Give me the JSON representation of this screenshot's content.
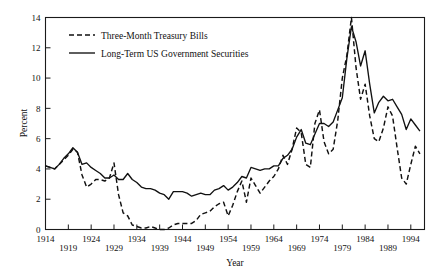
{
  "chart_data": {
    "type": "line",
    "title": "",
    "xlabel": "Year",
    "ylabel": "Percent",
    "xlim": [
      1914,
      1997
    ],
    "ylim": [
      0,
      14
    ],
    "grid": false,
    "legend_position": "top-left",
    "xticks": [
      1914,
      1919,
      1924,
      1929,
      1934,
      1939,
      1944,
      1949,
      1954,
      1959,
      1964,
      1969,
      1974,
      1979,
      1984,
      1989,
      1994
    ],
    "xtick_labels": [
      "1914",
      "1919",
      "1924",
      "1929",
      "1934",
      "1939",
      "1944",
      "1949",
      "1954",
      "1959",
      "1964",
      "1969",
      "1974",
      "1979",
      "1984",
      "1989",
      "1994"
    ],
    "xtick_stagger": "alternating-two-rows",
    "yticks": [
      0,
      2,
      4,
      6,
      8,
      10,
      12,
      14
    ],
    "ytick_labels": [
      "0",
      "2",
      "4",
      "6",
      "8",
      "10",
      "12",
      "14"
    ],
    "x": [
      1914,
      1915,
      1916,
      1917,
      1918,
      1919,
      1920,
      1921,
      1922,
      1923,
      1924,
      1925,
      1926,
      1927,
      1928,
      1929,
      1930,
      1931,
      1932,
      1933,
      1934,
      1935,
      1936,
      1937,
      1938,
      1939,
      1940,
      1941,
      1942,
      1943,
      1944,
      1945,
      1946,
      1947,
      1948,
      1949,
      1950,
      1951,
      1952,
      1953,
      1954,
      1955,
      1956,
      1957,
      1958,
      1959,
      1960,
      1961,
      1962,
      1963,
      1964,
      1965,
      1966,
      1967,
      1968,
      1969,
      1970,
      1971,
      1972,
      1973,
      1974,
      1975,
      1976,
      1977,
      1978,
      1979,
      1980,
      1981,
      1982,
      1983,
      1984,
      1985,
      1986,
      1987,
      1988,
      1989,
      1990,
      1991,
      1992,
      1993,
      1994,
      1995,
      1996
    ],
    "series": [
      {
        "name": "Three-Month Treasury Bills",
        "style": "dashed",
        "color": "#111111",
        "values": [
          4.2,
          4.1,
          4.0,
          4.3,
          4.6,
          4.9,
          5.3,
          5.1,
          3.6,
          2.8,
          3.0,
          3.3,
          3.3,
          3.2,
          3.4,
          4.4,
          2.3,
          1.1,
          0.9,
          0.3,
          0.2,
          0.1,
          0.1,
          0.2,
          0.1,
          0.0,
          0.0,
          0.1,
          0.3,
          0.4,
          0.4,
          0.4,
          0.4,
          0.6,
          1.0,
          1.1,
          1.2,
          1.5,
          1.7,
          1.8,
          0.9,
          1.6,
          2.5,
          3.2,
          1.8,
          3.4,
          2.9,
          2.4,
          2.8,
          3.2,
          3.5,
          4.0,
          4.9,
          4.3,
          5.3,
          6.7,
          6.4,
          4.3,
          4.1,
          7.0,
          7.9,
          5.8,
          5.0,
          5.3,
          7.2,
          10.0,
          11.5,
          14.0,
          10.7,
          8.6,
          9.6,
          7.5,
          6.0,
          5.8,
          6.7,
          8.1,
          7.5,
          5.4,
          3.4,
          3.0,
          4.3,
          5.5,
          5.0
        ]
      },
      {
        "name": "Long-Term US Government Securities",
        "style": "solid",
        "color": "#111111",
        "values": [
          4.2,
          4.1,
          4.0,
          4.3,
          4.7,
          5.0,
          5.4,
          5.1,
          4.3,
          4.4,
          4.1,
          3.9,
          3.7,
          3.4,
          3.4,
          3.6,
          3.3,
          3.3,
          3.7,
          3.3,
          3.1,
          2.8,
          2.7,
          2.7,
          2.6,
          2.4,
          2.3,
          2.0,
          2.5,
          2.5,
          2.5,
          2.4,
          2.2,
          2.3,
          2.4,
          2.3,
          2.3,
          2.6,
          2.7,
          2.9,
          2.6,
          2.8,
          3.1,
          3.5,
          3.4,
          4.1,
          4.0,
          3.9,
          4.0,
          4.0,
          4.2,
          4.2,
          4.7,
          4.9,
          5.3,
          6.1,
          6.6,
          5.7,
          5.6,
          6.3,
          7.0,
          7.0,
          6.8,
          7.1,
          7.9,
          8.7,
          11.3,
          13.4,
          12.4,
          10.8,
          11.8,
          9.6,
          7.7,
          8.4,
          8.8,
          8.5,
          8.6,
          8.1,
          7.6,
          6.6,
          7.3,
          6.9,
          6.5
        ]
      }
    ],
    "legend": [
      {
        "label": "Three-Month Treasury Bills",
        "style": "dashed"
      },
      {
        "label": "Long-Term US Government Securities",
        "style": "solid"
      }
    ]
  },
  "axes": {
    "y_title": "Percent",
    "x_title": "Year"
  }
}
